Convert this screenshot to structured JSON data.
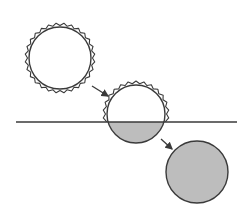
{
  "diagram": {
    "colors": {
      "background": "#ffffff",
      "stroke": "#3a3a3a",
      "fill_below_horizon": "#bdbdbd"
    },
    "horizon": {
      "x1": 16,
      "x2": 237,
      "y": 122
    },
    "suns": [
      {
        "id": "sun-in-sky",
        "cx": 60,
        "cy": 58,
        "r": 31,
        "rays": "full",
        "ray_outer": 35,
        "ray_count": 28
      },
      {
        "id": "sun-setting",
        "cx": 136,
        "cy": 114,
        "r": 29,
        "rays": "above-horizon",
        "ray_outer": 33,
        "ray_count": 26
      },
      {
        "id": "sun-below",
        "cx": 197,
        "cy": 172,
        "r": 31,
        "rays": "none"
      }
    ],
    "arrows": [
      {
        "id": "arrow-1",
        "x1": 92,
        "y1": 86,
        "x2": 108,
        "y2": 96
      },
      {
        "id": "arrow-2",
        "x1": 161,
        "y1": 139,
        "x2": 172,
        "y2": 149
      }
    ]
  }
}
